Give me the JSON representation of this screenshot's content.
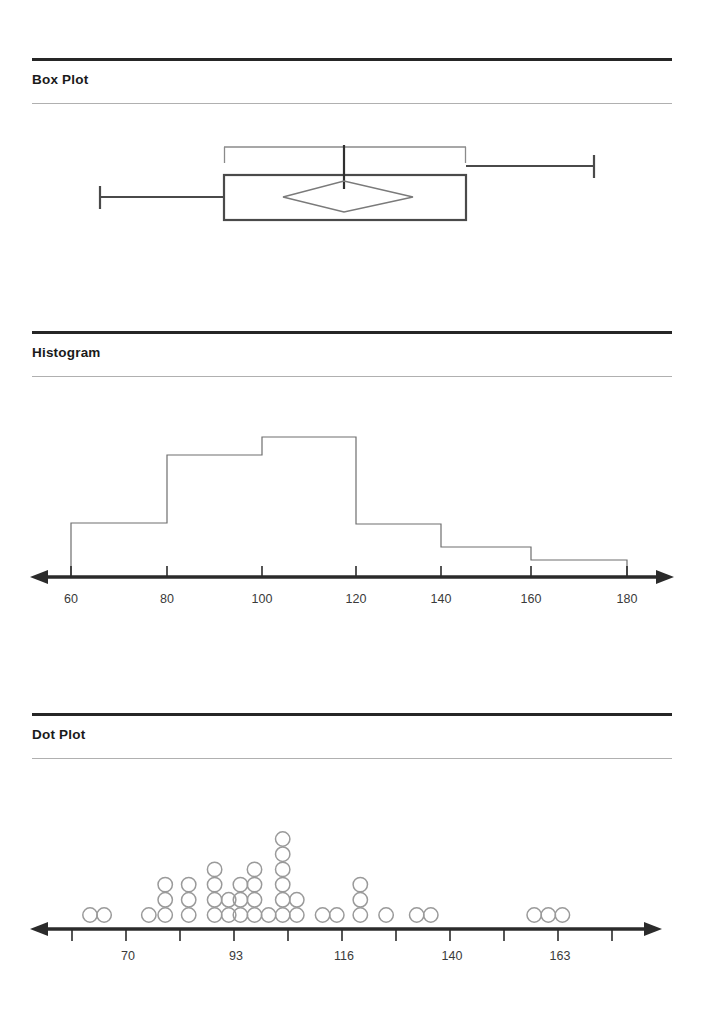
{
  "sections": [
    {
      "title": "Box Plot"
    },
    {
      "title": "Histogram"
    },
    {
      "title": "Dot Plot"
    }
  ],
  "colors": {
    "rule_dark": "#262626",
    "rule_light": "#b0b0b0",
    "stroke_heavy": "#3a3a3a",
    "stroke_light": "#8a8a8a",
    "axis": "#2b2b2b",
    "text": "#3a3a3a"
  },
  "chart_data": [
    {
      "type": "box",
      "title": "Box Plot",
      "orientation": "horizontal",
      "xlabel": "",
      "ylabel": "",
      "grid": false,
      "legend": false,
      "axis_visible": false,
      "tick_labels": [],
      "statistics": {
        "minimum": 60,
        "q1": 92,
        "median": 107,
        "q3": 142,
        "maximum": 176,
        "mean": 110,
        "mean_marker": "diamond",
        "confidence_interval_low": 98,
        "confidence_interval_high": 118
      },
      "pixel_geometry": {
        "whisker_low_x": 99,
        "box_left_x": 224,
        "median_x": 344,
        "box_right_x": 466,
        "whisker_high_x": 595,
        "bracket_top_y": 147,
        "bracket_bottom_y": 163,
        "box_top_y": 175,
        "box_bottom_y": 220,
        "diamond_left_x": 283,
        "diamond_right_x": 413,
        "whisker_y": 197
      }
    },
    {
      "type": "bar",
      "title": "Histogram",
      "xlabel": "",
      "ylabel": "",
      "grid": false,
      "legend": false,
      "bin_width": 20,
      "bin_edges": [
        60,
        80,
        100,
        120,
        140,
        160,
        180
      ],
      "categories": [
        "60-80",
        "80-100",
        "100-120",
        "120-140",
        "140-160",
        "160-180"
      ],
      "values": [
        13,
        30,
        35,
        13,
        7,
        4
      ],
      "tick_labels": [
        "60",
        "80",
        "100",
        "120",
        "140",
        "160",
        "180"
      ],
      "xlim": [
        60,
        180
      ],
      "ylim": [
        0,
        36
      ],
      "arrow_axis": true
    },
    {
      "type": "dot",
      "title": "Dot Plot",
      "xlabel": "",
      "ylabel": "",
      "grid": false,
      "legend": false,
      "tick_labels": [
        "70",
        "93",
        "116",
        "140",
        "163"
      ],
      "tick_label_values": [
        70,
        93,
        116,
        140,
        163
      ],
      "arrow_axis": true,
      "stacks": [
        {
          "x_value": 64,
          "count": 1
        },
        {
          "x_value": 70,
          "count": 1
        },
        {
          "x_value": 89,
          "count": 1
        },
        {
          "x_value": 96,
          "count": 3
        },
        {
          "x_value": 106,
          "count": 3
        },
        {
          "x_value": 117,
          "count": 4
        },
        {
          "x_value": 123,
          "count": 2
        },
        {
          "x_value": 128,
          "count": 3
        },
        {
          "x_value": 134,
          "count": 4
        },
        {
          "x_value": 140,
          "count": 1
        },
        {
          "x_value": 146,
          "count": 6
        },
        {
          "x_value": 152,
          "count": 2
        },
        {
          "x_value": 163,
          "count": 1
        },
        {
          "x_value": 169,
          "count": 1
        },
        {
          "x_value": 179,
          "count": 3
        },
        {
          "x_value": 190,
          "count": 1
        },
        {
          "x_value": 203,
          "count": 1
        },
        {
          "x_value": 209,
          "count": 1
        },
        {
          "x_value": 253,
          "count": 1
        },
        {
          "x_value": 259,
          "count": 1
        },
        {
          "x_value": 265,
          "count": 1
        }
      ],
      "total_dots": 42
    }
  ]
}
